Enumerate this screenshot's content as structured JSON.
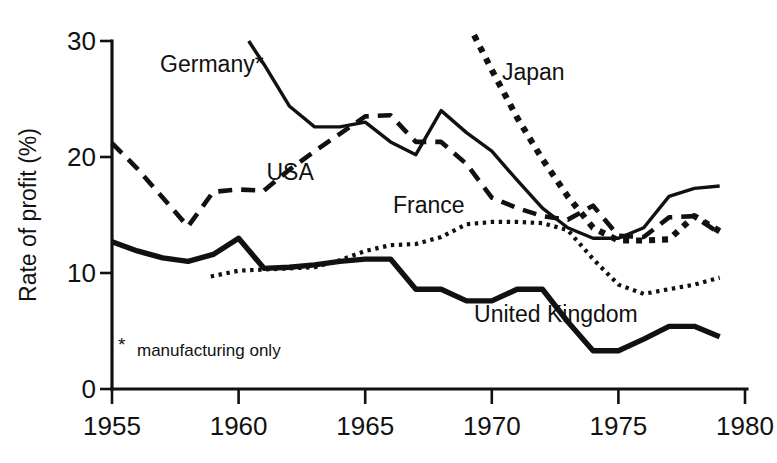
{
  "chart_data": {
    "type": "line",
    "title": "",
    "xlabel": "",
    "ylabel": "Rate of profit (%)",
    "xlim": [
      1955,
      1980
    ],
    "ylim": [
      0,
      30
    ],
    "xticks": [
      1955,
      1960,
      1965,
      1970,
      1975,
      1980
    ],
    "yticks": [
      0,
      10,
      20,
      30
    ],
    "grid": false,
    "legend_position": "inline-annotations",
    "footnote": "manufacturing only",
    "footnote_marker": "*",
    "series": [
      {
        "name": "Germany*",
        "label": "Germany*",
        "style": "solid",
        "label_x": 1956.9,
        "label_y": 27.3,
        "x": [
          1960.4,
          1961.0,
          1962.0,
          1963.0,
          1964.0,
          1965.0,
          1966.0,
          1967.0,
          1968.0,
          1969.0,
          1970.0,
          1971.0,
          1972.0,
          1973.0,
          1974.0,
          1975.0,
          1976.0,
          1977.0,
          1978.0,
          1979.0
        ],
        "y": [
          30.0,
          28.0,
          24.4,
          22.6,
          22.6,
          23.0,
          21.3,
          20.2,
          24.0,
          22.1,
          20.5,
          18.0,
          15.6,
          13.9,
          13.0,
          13.0,
          13.9,
          16.6,
          17.3,
          17.5
        ]
      },
      {
        "name": "USA",
        "label": "USA",
        "style": "dashed",
        "label_x": 1961.1,
        "label_y": 18.0,
        "x": [
          1955.0,
          1956.0,
          1957.0,
          1958.0,
          1959.0,
          1960.0,
          1961.0,
          1962.0,
          1963.0,
          1964.0,
          1965.0,
          1966.0,
          1967.0,
          1968.0,
          1969.0,
          1970.0,
          1971.0,
          1972.0,
          1973.0,
          1974.0,
          1975.0,
          1976.0,
          1977.0,
          1978.0,
          1979.0
        ],
        "y": [
          21.2,
          19.0,
          16.5,
          14.0,
          17.0,
          17.2,
          17.1,
          18.9,
          20.5,
          22.0,
          23.5,
          23.6,
          21.3,
          21.3,
          19.4,
          16.5,
          15.6,
          14.9,
          14.6,
          15.8,
          13.2,
          13.1,
          14.8,
          14.9,
          13.4
        ]
      },
      {
        "name": "Japan",
        "label": "Japan",
        "style": "dotted-bold",
        "label_x": 1970.4,
        "label_y": 26.6,
        "x": [
          1969.3,
          1970.0,
          1971.0,
          1972.0,
          1973.0,
          1974.0,
          1975.0,
          1976.0,
          1977.0,
          1978.0,
          1979.0
        ],
        "y": [
          30.5,
          27.5,
          23.4,
          19.8,
          16.6,
          13.9,
          12.8,
          12.8,
          12.9,
          14.9,
          13.6
        ]
      },
      {
        "name": "France",
        "label": "France",
        "style": "dotted-fine",
        "label_x": 1966.1,
        "label_y": 15.2,
        "x": [
          1958.9,
          1960.0,
          1961.0,
          1962.0,
          1963.0,
          1964.0,
          1965.0,
          1966.0,
          1967.0,
          1968.0,
          1969.0,
          1970.0,
          1971.0,
          1972.0,
          1973.0,
          1974.0,
          1975.0,
          1976.0,
          1977.0,
          1978.0,
          1979.0
        ],
        "y": [
          9.7,
          10.2,
          10.3,
          10.4,
          10.5,
          11.1,
          11.9,
          12.4,
          12.5,
          13.1,
          14.2,
          14.4,
          14.4,
          14.3,
          13.7,
          11.2,
          9.0,
          8.2,
          8.6,
          9.0,
          9.6
        ]
      },
      {
        "name": "United Kingdom",
        "label": "United Kingdom",
        "style": "thick",
        "label_x": 1969.3,
        "label_y": 5.8,
        "x": [
          1955.0,
          1956.0,
          1957.0,
          1958.0,
          1959.0,
          1960.0,
          1961.0,
          1962.0,
          1963.0,
          1964.0,
          1965.0,
          1966.0,
          1967.0,
          1968.0,
          1969.0,
          1970.0,
          1971.0,
          1972.0,
          1973.0,
          1974.0,
          1975.0,
          1976.0,
          1977.0,
          1978.0,
          1979.0
        ],
        "y": [
          12.7,
          11.9,
          11.3,
          11.0,
          11.6,
          13.0,
          10.4,
          10.5,
          10.7,
          11.0,
          11.2,
          11.2,
          8.6,
          8.6,
          7.6,
          7.6,
          8.6,
          8.6,
          5.8,
          3.3,
          3.3,
          4.3,
          5.4,
          5.4,
          4.5
        ]
      }
    ]
  },
  "axes": {
    "y_title": "Rate of profit (%)",
    "y_tick_labels": [
      "0",
      "10",
      "20",
      "30"
    ],
    "x_tick_labels": [
      "1955",
      "1960",
      "1965",
      "1970",
      "1975",
      "1980"
    ]
  },
  "colors": {
    "ink": "#111111",
    "background": "#ffffff"
  }
}
